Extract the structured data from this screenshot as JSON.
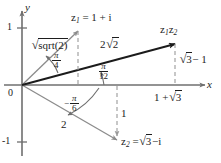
{
  "figure": {
    "colors": {
      "axis": "#6f6f6f",
      "vector_light": "#8c8c8c",
      "vector_dark": "#1b1b1b",
      "dashed": "#9a9a9a",
      "text": "#1d1d1d",
      "background": "#ffffff"
    },
    "axes": {
      "x_label": "x",
      "y_label": "y",
      "y_tick_top": "1",
      "y_tick_bottom": "-1",
      "origin_label": "0"
    },
    "points": [
      {
        "id": "z1",
        "label_prefix": "z",
        "label_sub": "1",
        "label_equals": "= 1 +",
        "label_imag": "i",
        "full_label": "z1 = 1 + i",
        "magnitude_label": "√2",
        "magnitude_value": "sqrt(2)",
        "angle_label": "π/4",
        "angle_num": "π",
        "angle_den": "4",
        "re": 1,
        "im": 1
      },
      {
        "id": "z2",
        "label_prefix": "z",
        "label_sub": "2",
        "label_equals": "=",
        "label_radicand": "3",
        "label_tail": "−",
        "label_imag": "i",
        "full_label": "z2 = √3 − i",
        "magnitude_label": "2",
        "magnitude_value": "2",
        "angle_label": "-π/6",
        "angle_sign": "−",
        "angle_num": "π",
        "angle_den": "6",
        "re": 1.732,
        "im": -1
      },
      {
        "id": "z1z2",
        "label_prefix": "z",
        "label_sub1": "1",
        "label_sub2": "2",
        "full_label": "z1z2",
        "magnitude_label": "2√2",
        "magnitude_coeff": "2",
        "magnitude_radicand": "2",
        "angle_label": "π/12",
        "angle_num": "π",
        "angle_den": "12",
        "re": 2.732,
        "im": 0.732
      }
    ],
    "projection_labels": {
      "z1z2_real": "1 + √3",
      "z1z2_real_prefix": "1 +",
      "z1z2_real_radicand": "3",
      "z1z2_imag": "√3 − 1",
      "z1z2_imag_radicand": "3",
      "z1z2_imag_tail": "− 1",
      "z2_imag": "1"
    }
  }
}
